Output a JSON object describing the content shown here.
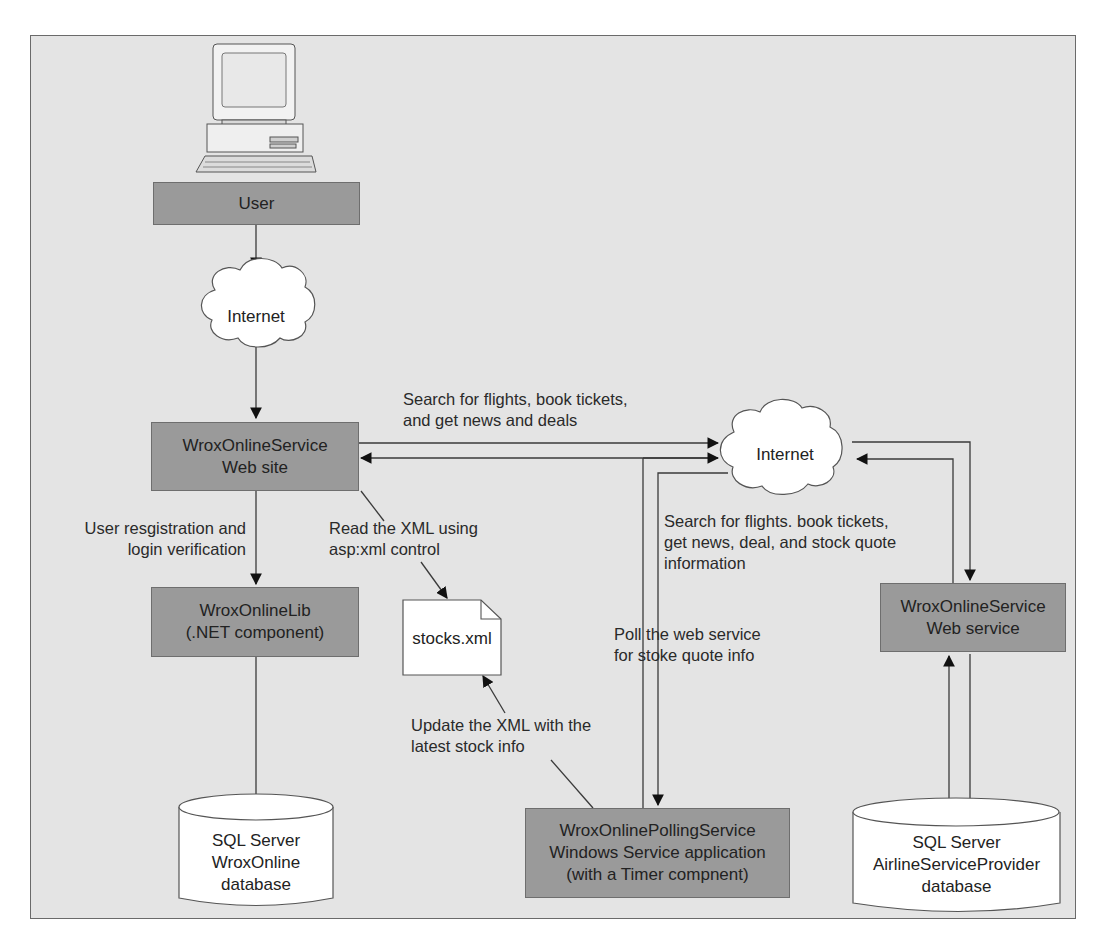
{
  "diagram": {
    "nodes": {
      "user": {
        "label": "User"
      },
      "internet_top": {
        "label": "Internet"
      },
      "website": {
        "line1": "WroxOnlineService",
        "line2": "Web site"
      },
      "internet_right": {
        "label": "Internet"
      },
      "lib": {
        "line1": "WroxOnlineLib",
        "line2": "(.NET component)"
      },
      "stocks_xml": {
        "label": "stocks.xml"
      },
      "webservice": {
        "line1": "WroxOnlineService",
        "line2": "Web service"
      },
      "db_wroxonline": {
        "line1": "SQL Server",
        "line2": "WroxOnline",
        "line3": "database"
      },
      "polling": {
        "line1": "WroxOnlinePollingService",
        "line2": "Windows Service application",
        "line3": "(with a Timer compnent)"
      },
      "db_airline": {
        "line1": "SQL Server",
        "line2": "AirlineServiceProvider",
        "line3": "database"
      }
    },
    "edge_labels": {
      "search_top": {
        "line1": "Search for flights, book tickets,",
        "line2": "and get news and deals"
      },
      "registration": {
        "line1": "User resgistration and",
        "line2": "login verification"
      },
      "read_xml": {
        "line1": "Read the XML using",
        "line2": "asp:xml control"
      },
      "search_right": {
        "line1": "Search for flights. book tickets,",
        "line2": "get news, deal, and stock quote",
        "line3": "information"
      },
      "poll": {
        "line1": "Poll the web service",
        "line2": "for stoke quote info"
      },
      "update_xml": {
        "line1": "Update the XML with the",
        "line2": "latest stock info"
      }
    },
    "colors": {
      "background": "#e4e4e4",
      "box_fill": "#9a9a9a",
      "shape_fill": "#ffffff",
      "line": "#3a3a3a"
    }
  }
}
